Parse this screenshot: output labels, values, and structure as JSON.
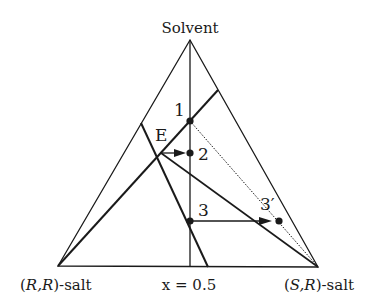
{
  "diagram": {
    "type": "ternary-phase-diagram",
    "vertices": {
      "top": "Solvent",
      "bottom_left_prefix": "(",
      "bottom_left_italic": "R,R",
      "bottom_left_suffix": ")-salt",
      "bottom_right_prefix": "(",
      "bottom_right_italic": "S,R",
      "bottom_right_suffix": ")-salt"
    },
    "axis_label": "x = 0.5",
    "points": [
      {
        "id": "1",
        "label": "1"
      },
      {
        "id": "2",
        "label": "2"
      },
      {
        "id": "3",
        "label": "3"
      },
      {
        "id": "3p",
        "label": "3′"
      },
      {
        "id": "E",
        "label": "E"
      }
    ],
    "colors": {
      "line": "#1a1a1a",
      "background": "#ffffff"
    }
  }
}
